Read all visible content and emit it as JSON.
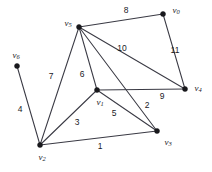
{
  "figure": {
    "kind": "undirected-weighted-graph",
    "background_color": "#ffffff",
    "edge_color": "#3a3a44",
    "vertex_color": "#18181c",
    "label_color": "#1a1a1f",
    "width": 212,
    "height": 172
  },
  "vertices": [
    {
      "id": "v0",
      "name": "v",
      "sub": "0",
      "x": 163,
      "y": 14,
      "label_x": 176,
      "label_y": 11
    },
    {
      "id": "v1",
      "name": "v",
      "sub": "1",
      "x": 97,
      "y": 90,
      "label_x": 100,
      "label_y": 103
    },
    {
      "id": "v2",
      "name": "v",
      "sub": "2",
      "x": 40,
      "y": 145,
      "label_x": 42,
      "label_y": 158
    },
    {
      "id": "v3",
      "name": "v",
      "sub": "3",
      "x": 157,
      "y": 131,
      "label_x": 168,
      "label_y": 143
    },
    {
      "id": "v4",
      "name": "v",
      "sub": "4",
      "x": 185,
      "y": 89,
      "label_x": 198,
      "label_y": 89
    },
    {
      "id": "v5",
      "name": "v",
      "sub": "5",
      "x": 79,
      "y": 27,
      "label_x": 68,
      "label_y": 24
    },
    {
      "id": "v6",
      "name": "v",
      "sub": "6",
      "x": 17,
      "y": 66,
      "label_x": 16,
      "label_y": 56
    }
  ],
  "edges": [
    {
      "from": "v2",
      "to": "v3",
      "weight": "1",
      "label_x": 100,
      "label_y": 146
    },
    {
      "from": "v5",
      "to": "v3",
      "weight": "2",
      "label_x": 147,
      "label_y": 105
    },
    {
      "from": "v2",
      "to": "v1",
      "weight": "3",
      "label_x": 77,
      "label_y": 122
    },
    {
      "from": "v6",
      "to": "v2",
      "weight": "4",
      "label_x": 20,
      "label_y": 109
    },
    {
      "from": "v1",
      "to": "v3",
      "weight": "5",
      "label_x": 114,
      "label_y": 113
    },
    {
      "from": "v5",
      "to": "v1",
      "weight": "6",
      "label_x": 82,
      "label_y": 74
    },
    {
      "from": "v5",
      "to": "v2",
      "weight": "7",
      "label_x": 51,
      "label_y": 76
    },
    {
      "from": "v5",
      "to": "v0",
      "weight": "8",
      "label_x": 126,
      "label_y": 10
    },
    {
      "from": "v1",
      "to": "v4",
      "weight": "9",
      "label_x": 162,
      "label_y": 96
    },
    {
      "from": "v5",
      "to": "v4",
      "weight": "10",
      "label_x": 122,
      "label_y": 48
    },
    {
      "from": "v0",
      "to": "v4",
      "weight": "11",
      "label_x": 175,
      "label_y": 50
    }
  ]
}
